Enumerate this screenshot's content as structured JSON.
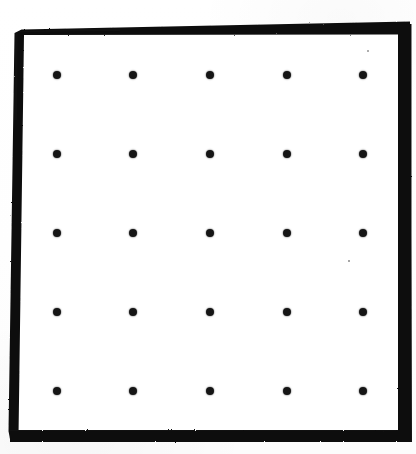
{
  "figure": {
    "description": "Scanned black-bordered rectangular plate containing a regular 5 by 5 array of round black dots on a white field.",
    "caption": ""
  },
  "colors": {
    "frame": "#111111",
    "dot": "#151515",
    "field": "#ffffff",
    "paper": "#fdfdfd"
  },
  "frame": {
    "name": "border-frame",
    "style": "tapered-wedge",
    "outer": {
      "left": 8,
      "top": 22,
      "right": 412,
      "bottom": 442
    },
    "inner": {
      "left": 18,
      "top": 36,
      "right": 398,
      "bottom": 430
    },
    "thickness": {
      "top_left": 1,
      "top_right": 13,
      "left_top": 1,
      "left_bottom": 10,
      "right": 13,
      "bottom": 11
    }
  },
  "chart_data": {
    "type": "scatter",
    "xlabel": "",
    "ylabel": "",
    "rows": 5,
    "cols": 5,
    "count": 25,
    "dot_diameter_px": 8,
    "col_spacing_px": 76.3,
    "row_spacing_px": 78.9,
    "xlim": [
      18,
      398
    ],
    "ylim": [
      36,
      430
    ],
    "grid": false,
    "legend": "none",
    "x": [
      57,
      133,
      210,
      287,
      363
    ],
    "y": [
      75,
      154,
      233,
      312,
      391
    ],
    "points": [
      {
        "row": 1,
        "col": 1,
        "cx": 57,
        "cy": 75
      },
      {
        "row": 1,
        "col": 2,
        "cx": 133,
        "cy": 75
      },
      {
        "row": 1,
        "col": 3,
        "cx": 210,
        "cy": 75
      },
      {
        "row": 1,
        "col": 4,
        "cx": 287,
        "cy": 75
      },
      {
        "row": 1,
        "col": 5,
        "cx": 363,
        "cy": 75
      },
      {
        "row": 2,
        "col": 1,
        "cx": 57,
        "cy": 154
      },
      {
        "row": 2,
        "col": 2,
        "cx": 133,
        "cy": 154
      },
      {
        "row": 2,
        "col": 3,
        "cx": 210,
        "cy": 154
      },
      {
        "row": 2,
        "col": 4,
        "cx": 287,
        "cy": 154
      },
      {
        "row": 2,
        "col": 5,
        "cx": 363,
        "cy": 154
      },
      {
        "row": 3,
        "col": 1,
        "cx": 57,
        "cy": 233
      },
      {
        "row": 3,
        "col": 2,
        "cx": 133,
        "cy": 233
      },
      {
        "row": 3,
        "col": 3,
        "cx": 210,
        "cy": 233
      },
      {
        "row": 3,
        "col": 4,
        "cx": 287,
        "cy": 233
      },
      {
        "row": 3,
        "col": 5,
        "cx": 363,
        "cy": 233
      },
      {
        "row": 4,
        "col": 1,
        "cx": 57,
        "cy": 312
      },
      {
        "row": 4,
        "col": 2,
        "cx": 133,
        "cy": 312
      },
      {
        "row": 4,
        "col": 3,
        "cx": 210,
        "cy": 312
      },
      {
        "row": 4,
        "col": 4,
        "cx": 287,
        "cy": 312
      },
      {
        "row": 4,
        "col": 5,
        "cx": 363,
        "cy": 312
      },
      {
        "row": 5,
        "col": 1,
        "cx": 57,
        "cy": 391
      },
      {
        "row": 5,
        "col": 2,
        "cx": 133,
        "cy": 391
      },
      {
        "row": 5,
        "col": 3,
        "cx": 210,
        "cy": 391
      },
      {
        "row": 5,
        "col": 4,
        "cx": 287,
        "cy": 391
      },
      {
        "row": 5,
        "col": 5,
        "cx": 363,
        "cy": 391
      }
    ]
  },
  "artifacts": [
    {
      "name": "scan-speck-top-right",
      "cx": 368,
      "cy": 51,
      "r": 1.1
    },
    {
      "name": "scan-speck-mid-right",
      "cx": 349,
      "cy": 261,
      "r": 0.8
    }
  ]
}
